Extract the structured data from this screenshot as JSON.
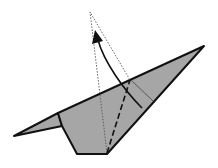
{
  "diagram": {
    "type": "origami-fold-step",
    "colors": {
      "paper_fill": "#a6a6a6",
      "outline": "#111111",
      "dotted_guide": "#555555",
      "background": "#ffffff"
    },
    "elements": [
      {
        "name": "paper-body",
        "kind": "filled-polygon"
      },
      {
        "name": "valley-fold-line",
        "kind": "dashed-line"
      },
      {
        "name": "fold-result-guide",
        "kind": "dotted-outline"
      },
      {
        "name": "fold-arrow",
        "kind": "curved-arrow"
      },
      {
        "name": "crease-line",
        "kind": "thin-line"
      }
    ]
  }
}
